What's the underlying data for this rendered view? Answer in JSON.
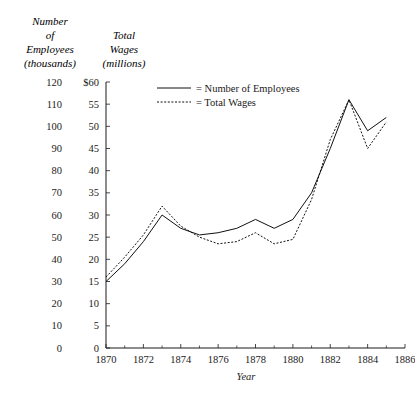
{
  "header": {
    "left_axis_title_lines": [
      "Number",
      "of",
      "Employees",
      "(thousands)"
    ],
    "right_axis_title_lines": [
      "Total",
      "Wages",
      "(millions)"
    ]
  },
  "chart_data": {
    "type": "line",
    "title": "",
    "xlabel": "Year",
    "ylabel": "Number of Employees (thousands)",
    "y2label": "Total Wages (millions)",
    "xlim": [
      1870,
      1886
    ],
    "ylim": [
      0,
      120
    ],
    "y2lim": [
      0,
      60
    ],
    "grid": false,
    "legend_position": "top-center",
    "x_tick_labels": [
      "1870",
      "1872",
      "1874",
      "1876",
      "1878",
      "1880",
      "1882",
      "1884",
      "1886"
    ],
    "x_ticks": [
      1870,
      1872,
      1874,
      1876,
      1878,
      1880,
      1882,
      1884,
      1886
    ],
    "x_minor_ticks": [
      1871,
      1873,
      1875,
      1877,
      1879,
      1881,
      1883,
      1885
    ],
    "y_tick_labels": [
      "0",
      "10",
      "20",
      "30",
      "40",
      "50",
      "60",
      "70",
      "80",
      "90",
      "100",
      "110",
      "120"
    ],
    "y_ticks": [
      0,
      10,
      20,
      30,
      40,
      50,
      60,
      70,
      80,
      90,
      100,
      110,
      120
    ],
    "y2_tick_labels": [
      "0",
      "5",
      "10",
      "15",
      "20",
      "25",
      "30",
      "35",
      "40",
      "45",
      "50",
      "55",
      "$60"
    ],
    "y2_ticks": [
      0,
      5,
      10,
      15,
      20,
      25,
      30,
      35,
      40,
      45,
      50,
      55,
      60
    ],
    "x": [
      1870,
      1871,
      1872,
      1873,
      1874,
      1875,
      1876,
      1877,
      1878,
      1879,
      1880,
      1881,
      1882,
      1883,
      1884,
      1885
    ],
    "series": [
      {
        "name": "Number of Employees",
        "style": "solid",
        "color": "#111111",
        "axis": "left",
        "values": [
          30,
          38,
          48,
          60,
          54,
          51,
          52,
          54,
          58,
          54,
          58,
          70,
          90,
          112,
          98,
          104
        ]
      },
      {
        "name": "Total Wages",
        "style": "dotted",
        "color": "#111111",
        "axis": "right",
        "values": [
          16,
          20.5,
          25.5,
          32,
          27.5,
          25,
          23.5,
          24,
          26,
          23.5,
          24.5,
          33.5,
          47,
          56,
          45,
          51
        ]
      }
    ],
    "legend": [
      {
        "label": "= Number of Employees",
        "style": "solid"
      },
      {
        "label": "= Total Wages",
        "style": "dotted"
      }
    ]
  }
}
